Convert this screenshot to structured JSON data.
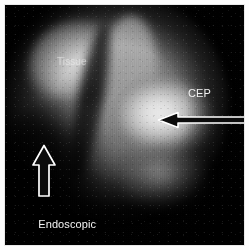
{
  "figure": {
    "kind": "endoscopic-photograph",
    "modality": "endoscopic grayscale view",
    "frame_color": "#000000",
    "border_color": "#e9e9e9",
    "width": 249,
    "height": 250
  },
  "annotations": {
    "cep": {
      "label": "CEP",
      "color": "#f2f2f2",
      "arrow": {
        "name": "cep-arrow",
        "direction": "left",
        "style": "hollow-outline",
        "stroke": "#ffffff",
        "fill": "#0a0a0a"
      }
    },
    "tissue": {
      "label": "Tissue",
      "color": "#ececec"
    },
    "shield": {
      "label_line1": "Endoscopic",
      "label_line2": "shield",
      "color": "#f4f4f4",
      "arrow": {
        "name": "endoscopic-shield-arrow",
        "direction": "up",
        "style": "hollow-outline",
        "stroke": "#ffffff",
        "fill": "#0a0a0a"
      }
    }
  }
}
